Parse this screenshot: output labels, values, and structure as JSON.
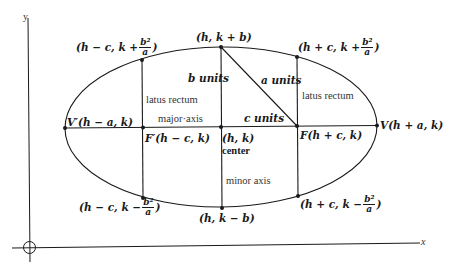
{
  "axes": {
    "x_label": "x",
    "y_label": "y"
  },
  "labels": {
    "top_vertex": "(h, k + b)",
    "bottom_vertex": "(h, k − b)",
    "left_vertex": "V′(h − a, k)",
    "right_vertex": "V(h + a, k)",
    "left_focus": "F′(h − c, k)",
    "right_focus": "F(h + c, k)",
    "center_coords": "(h, k)",
    "center_word": "center",
    "b_units": "b units",
    "a_units": "a units",
    "c_units": "c units",
    "latus_rectum_left": "latus rectum",
    "latus_rectum_right": "latus rectum",
    "major_axis": "major·axis",
    "minor_axis": "minor axis",
    "lr_left_top": {
      "prefix": "(h − c, k +",
      "num": "b²",
      "den": "a",
      "suffix": ")"
    },
    "lr_right_top": {
      "prefix": "(h + c, k +",
      "num": "b²",
      "den": "a",
      "suffix": ")"
    },
    "lr_left_bottom": {
      "prefix": "(h − c, k −",
      "num": "b²",
      "den": "a",
      "suffix": ")"
    },
    "lr_right_bottom": {
      "prefix": "(h + c, k −",
      "num": "b²",
      "den": "a",
      "suffix": ")"
    }
  },
  "colors": {
    "stroke": "#1a1a1a",
    "background": "#ffffff"
  }
}
